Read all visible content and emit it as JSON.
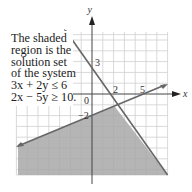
{
  "caption": {
    "lines": [
      "The shaded",
      "region is the",
      "solution set",
      "of the system",
      "3x + 2y ≤ 6",
      "2x − 5y ≥ 10."
    ]
  },
  "axes": {
    "x_label": "x",
    "y_label": "y",
    "origin_label": "0",
    "tick_labels": {
      "x_2": "2",
      "x_5": "5",
      "y_3": "3",
      "y_neg2": "−2"
    }
  },
  "colors": {
    "grid": "#cfcfcf",
    "axis": "#444444",
    "line": "#666666",
    "shade": "#a8a8a8"
  },
  "chart_data": {
    "type": "region",
    "xlabel": "x",
    "ylabel": "y",
    "xlim": [
      -7,
      7
    ],
    "ylim": [
      -7.5,
      5.8
    ],
    "grid": true,
    "lines": [
      {
        "equation": "3x + 2y = 6",
        "x_intercept": 2,
        "y_intercept": 3,
        "inequality": "<="
      },
      {
        "equation": "2x - 5y = 10",
        "x_intercept": 5,
        "y_intercept": -2,
        "inequality": ">="
      }
    ],
    "intersection": [
      2.105,
      -1.158
    ],
    "annotated_values": {
      "x": [
        2,
        5
      ],
      "y": [
        3,
        -2
      ]
    }
  }
}
